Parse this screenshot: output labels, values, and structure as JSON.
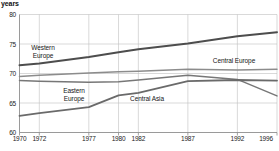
{
  "chart_data": {
    "type": "line",
    "title": "",
    "ylabel": "years",
    "xlabel": "",
    "x": [
      1970,
      1972,
      1977,
      1980,
      1982,
      1987,
      1992,
      1996
    ],
    "xtick_labels": [
      "1970",
      "1972",
      "1977",
      "1980",
      "1982",
      "1987",
      "1992",
      "1996"
    ],
    "ytick_labels": [
      "80",
      "75",
      "70",
      "65",
      "60"
    ],
    "ytick_values": [
      80,
      75,
      70,
      65,
      60
    ],
    "ylim": [
      60,
      80
    ],
    "xlim": [
      1970,
      1996
    ],
    "grid": true,
    "legend_position": "inline-annotations",
    "series": [
      {
        "name": "Western Europe",
        "color": "#4d4d4d",
        "values": [
          71.4,
          71.7,
          72.8,
          73.6,
          74.1,
          75.1,
          76.3,
          77.0
        ]
      },
      {
        "name": "Central Europe",
        "color": "#8c8c8c",
        "values": [
          69.5,
          69.7,
          70.1,
          70.3,
          70.4,
          70.7,
          70.6,
          70.7
        ]
      },
      {
        "name": "Eastern Europe",
        "color": "#777777",
        "values": [
          68.8,
          68.7,
          68.5,
          68.6,
          68.9,
          69.7,
          69.0,
          66.2
        ]
      },
      {
        "name": "Central Asia",
        "color": "#6a6a6a",
        "values": [
          62.8,
          63.3,
          64.3,
          66.3,
          66.7,
          68.7,
          68.9,
          68.8
        ]
      }
    ],
    "annotations": [
      {
        "text": "Western\nEurope",
        "series": "Western Europe"
      },
      {
        "text": "Central Europe",
        "series": "Central Europe"
      },
      {
        "text": "Eastern\nEurope",
        "series": "Eastern Europe"
      },
      {
        "text": "Central Asia",
        "series": "Central Asia"
      }
    ]
  }
}
